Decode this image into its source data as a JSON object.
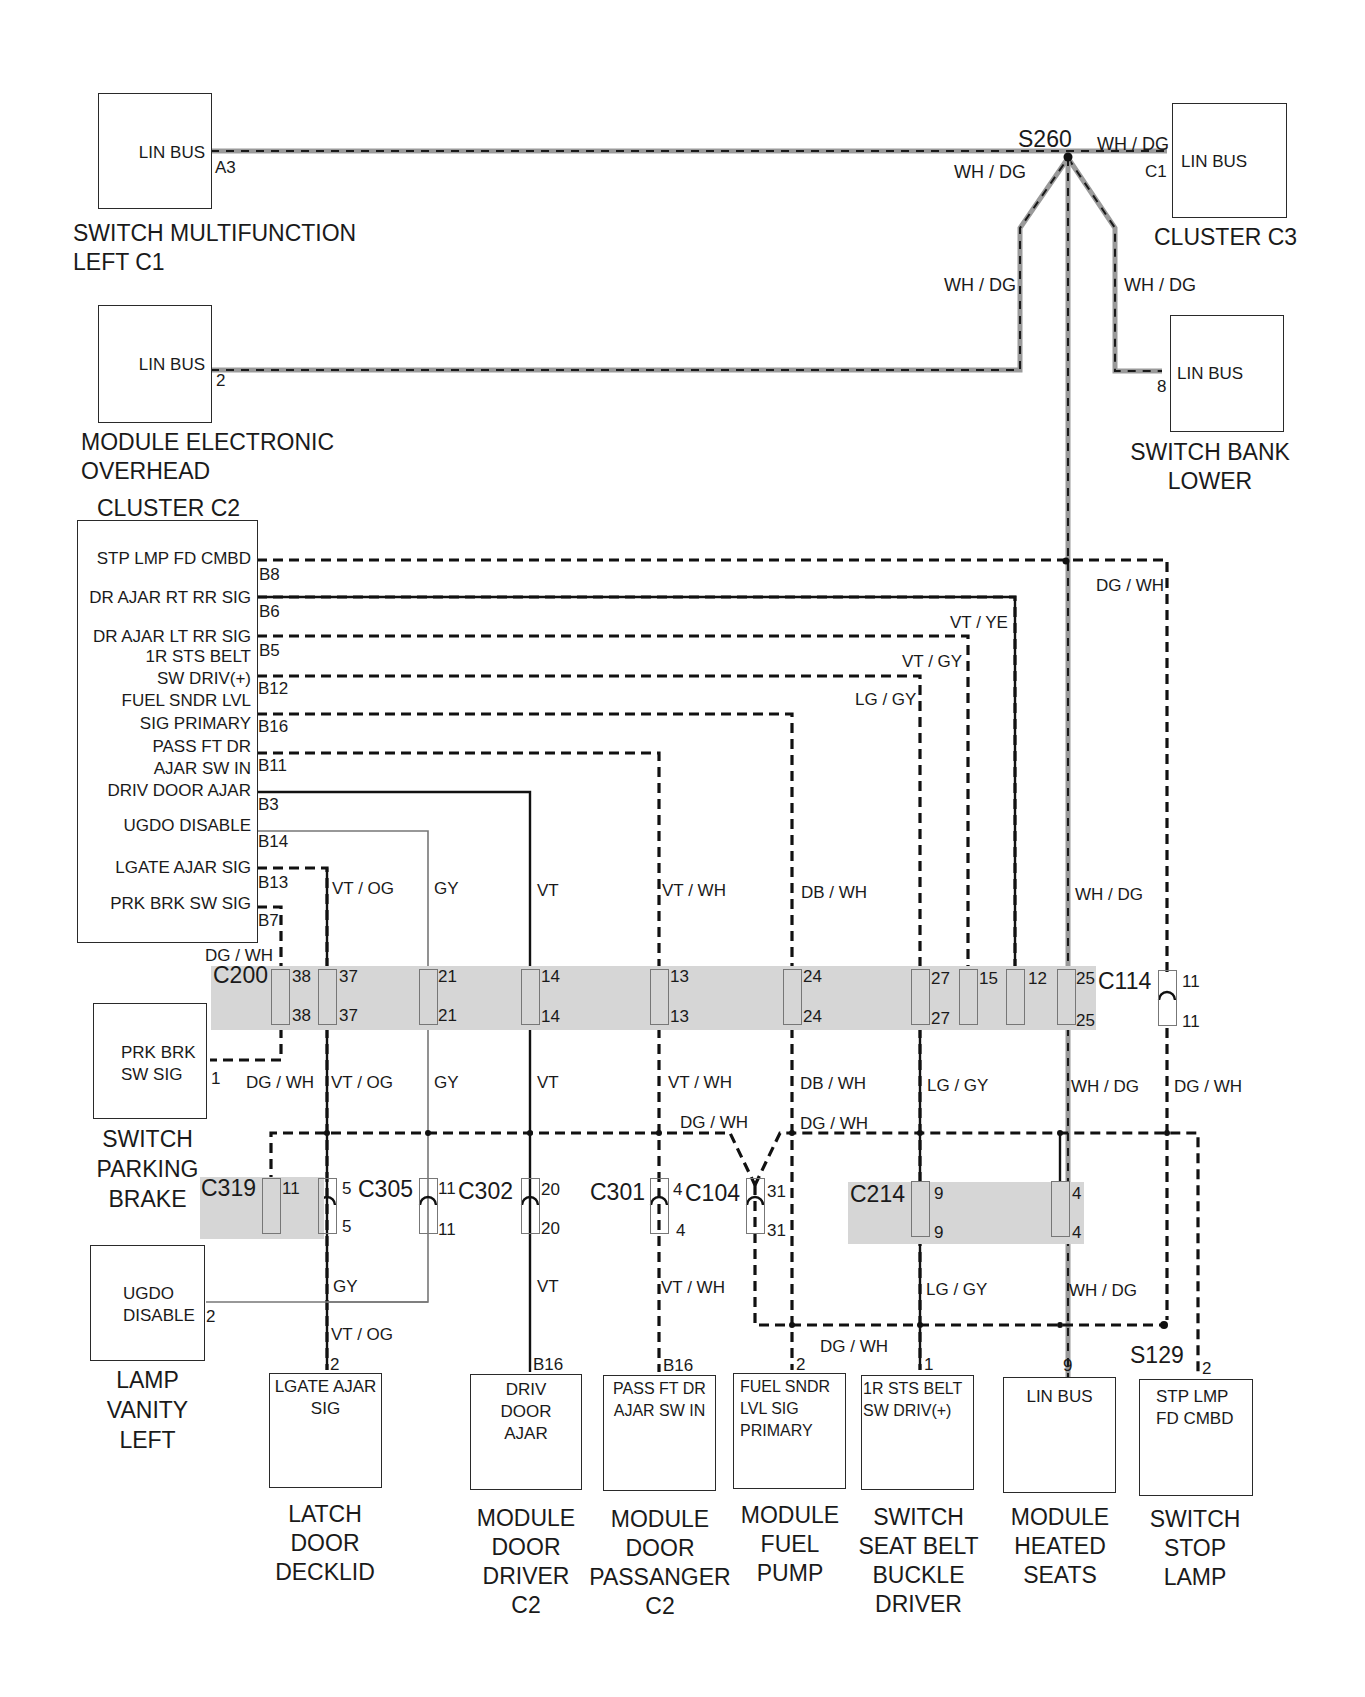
{
  "diagram": {
    "splices": {
      "s260": "S260",
      "s129": "S129"
    },
    "top_components": {
      "switch_multifunction": {
        "inner": "LIN BUS",
        "pin": "A3",
        "caption": [
          "SWITCH MULTIFUNCTION",
          "LEFT C1"
        ]
      },
      "module_overhead": {
        "inner": "LIN BUS",
        "pin": "2",
        "caption": [
          "MODULE ELECTRONIC",
          "OVERHEAD"
        ]
      },
      "cluster_c3": {
        "inner": "LIN BUS",
        "pin": "C1",
        "caption": [
          "CLUSTER C3"
        ]
      },
      "switch_bank": {
        "inner": "LIN BUS",
        "pin": "8",
        "caption": [
          "SWITCH BANK",
          "LOWER"
        ]
      }
    },
    "lin_wire_labels": {
      "left": "WH / DG",
      "right_top": "WH / DG",
      "branch_left": "WH / DG",
      "branch_right": "WH / DG",
      "vertical": "WH / DG"
    },
    "cluster_c2": {
      "title": "CLUSTER C2",
      "signals": [
        {
          "name": "STP LMP FD CMBD",
          "pin": "B8"
        },
        {
          "name": "DR AJAR RT RR SIG",
          "pin": "B6"
        },
        {
          "name": "DR AJAR LT RR SIG",
          "pin": "B5"
        },
        {
          "name": "1R STS BELT",
          "name2": "SW DRIV(+)",
          "pin": "B12"
        },
        {
          "name": "FUEL SNDR LVL",
          "name2": "SIG PRIMARY",
          "pin": "B16"
        },
        {
          "name": "PASS FT DR",
          "name2": "AJAR SW IN",
          "pin": "B11"
        },
        {
          "name": "DRIV DOOR AJAR",
          "pin": "B3"
        },
        {
          "name": "UGDO DISABLE",
          "pin": "B14"
        },
        {
          "name": "LGATE AJAR SIG",
          "pin": "B13"
        },
        {
          "name": "PRK BRK SW SIG",
          "pin": "B7"
        }
      ]
    },
    "upper_wire_labels": {
      "dg_wh_top": "DG / WH",
      "vt_ye": "VT / YE",
      "vt_gy": "VT / GY",
      "lg_gy": "LG / GY",
      "dg_wh_b7": "DG / WH",
      "vt_og": "VT / OG",
      "gy": "GY",
      "vt": "VT",
      "vt_wh": "VT / WH",
      "db_wh": "DB / WH",
      "wh_dg": "WH / DG"
    },
    "connectors": {
      "c200": {
        "name": "C200",
        "pins": [
          "38",
          "37",
          "21",
          "14",
          "13",
          "24",
          "27"
        ]
      },
      "c114": {
        "name": "C114",
        "pins": [
          "15",
          "12",
          "25",
          "11"
        ]
      },
      "c319": {
        "name": "C319",
        "pins": [
          "11",
          "5"
        ]
      },
      "c305": {
        "name": "C305",
        "pins": [
          "11"
        ]
      },
      "c302": {
        "name": "C302",
        "pins": [
          "20"
        ]
      },
      "c301": {
        "name": "C301",
        "pins": [
          "4"
        ]
      },
      "c104": {
        "name": "C104",
        "pins": [
          "31"
        ]
      },
      "c214": {
        "name": "C214",
        "pins": [
          "9",
          "4"
        ]
      }
    },
    "mid_wire_labels": {
      "dg_wh": "DG / WH",
      "vt_og": "VT / OG",
      "gy": "GY",
      "vt": "VT",
      "vt_wh": "VT / WH",
      "db_wh": "DB / WH",
      "lg_gy": "LG / GY",
      "wh_dg": "WH / DG",
      "dg_wh_right": "DG / WH",
      "dg_wh_bus1": "DG / WH",
      "dg_wh_bus2": "DG / WH"
    },
    "lower_wire_labels": {
      "gy": "GY",
      "vt_og": "VT / OG",
      "vt": "VT",
      "vt_wh": "VT / WH",
      "lg_gy": "LG / GY",
      "wh_dg": "WH / DG",
      "dg_wh": "DG / WH"
    },
    "left_components": {
      "switch_parking_brake": {
        "inner": [
          "PRK BRK",
          "SW SIG"
        ],
        "pin": "1",
        "caption": [
          "SWITCH",
          "PARKING",
          "BRAKE"
        ]
      },
      "lamp_vanity": {
        "inner": [
          "UGDO",
          "DISABLE"
        ],
        "pin": "2",
        "caption": [
          "LAMP",
          "VANITY",
          "LEFT"
        ]
      }
    },
    "bottom_components": [
      {
        "inner": [
          "LGATE AJAR",
          "SIG"
        ],
        "pin": "2",
        "caption": [
          "LATCH",
          "DOOR",
          "DECKLID"
        ]
      },
      {
        "inner": [
          "DRIV",
          "DOOR",
          "AJAR"
        ],
        "pin": "B16",
        "caption": [
          "MODULE",
          "DOOR",
          "DRIVER",
          "C2"
        ]
      },
      {
        "inner": [
          "PASS FT DR",
          "AJAR SW IN"
        ],
        "pin": "B16",
        "caption": [
          "MODULE",
          "DOOR",
          "PASSANGER",
          "C2"
        ]
      },
      {
        "inner": [
          "FUEL SNDR",
          "LVL SIG",
          "PRIMARY"
        ],
        "pin": "2",
        "caption": [
          "MODULE",
          "FUEL",
          "PUMP"
        ]
      },
      {
        "inner": [
          "1R STS BELT",
          "SW DRIV(+)"
        ],
        "pin": "1",
        "caption": [
          "SWITCH",
          "SEAT BELT",
          "BUCKLE",
          "DRIVER"
        ]
      },
      {
        "inner": [
          "LIN BUS"
        ],
        "pin": "9",
        "caption": [
          "MODULE",
          "HEATED",
          "SEATS"
        ]
      },
      {
        "inner": [
          "STP LMP",
          "FD CMBD"
        ],
        "pin": "2",
        "caption": [
          "SWITCH",
          "STOP",
          "LAMP"
        ]
      }
    ]
  }
}
